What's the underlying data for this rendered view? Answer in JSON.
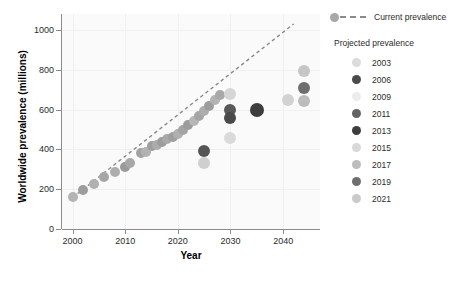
{
  "chart_data": {
    "type": "scatter",
    "title": "",
    "xlabel": "Year",
    "ylabel": "Worldwide prevalence (millions)",
    "xlim": [
      1998,
      2047
    ],
    "ylim": [
      0,
      1080
    ],
    "xticks": [
      2000,
      2010,
      2020,
      2030,
      2040
    ],
    "yticks": [
      0,
      200,
      400,
      600,
      800,
      1000
    ],
    "grid": true,
    "legend_position": "right",
    "trendline": {
      "label": "Current prevalence",
      "style": "dashed",
      "color": "#8a8a8a",
      "x_start": 2000,
      "y_start": 158,
      "x_end": 2042,
      "y_end": 1030
    },
    "series": [
      {
        "name": "Current prevalence",
        "marker": "circle",
        "points": [
          {
            "x": 2000,
            "y": 160,
            "color": "#b4b4b4",
            "size": 5
          },
          {
            "x": 2002,
            "y": 196,
            "color": "#9d9d9d",
            "size": 5
          },
          {
            "x": 2004,
            "y": 225,
            "color": "#b0b0b0",
            "size": 5
          },
          {
            "x": 2006,
            "y": 262,
            "color": "#a6a6a6",
            "size": 5
          },
          {
            "x": 2008,
            "y": 285,
            "color": "#aeaeae",
            "size": 5
          },
          {
            "x": 2010,
            "y": 311,
            "color": "#9a9a9a",
            "size": 5
          },
          {
            "x": 2011,
            "y": 330,
            "color": "#a8a8a8",
            "size": 5
          },
          {
            "x": 2013,
            "y": 382,
            "color": "#a2a2a2",
            "size": 5
          },
          {
            "x": 2014,
            "y": 387,
            "color": "#b2b2b2",
            "size": 5
          },
          {
            "x": 2015,
            "y": 415,
            "color": "#9e9e9e",
            "size": 5
          },
          {
            "x": 2016,
            "y": 422,
            "color": "#acacac",
            "size": 5
          },
          {
            "x": 2017,
            "y": 438,
            "color": "#9c9c9c",
            "size": 5
          },
          {
            "x": 2018,
            "y": 451,
            "color": "#a9a9a9",
            "size": 5
          },
          {
            "x": 2019,
            "y": 463,
            "color": "#9f9f9f",
            "size": 5
          },
          {
            "x": 2020,
            "y": 478,
            "color": "#b0b0b0",
            "size": 5
          },
          {
            "x": 2021,
            "y": 497,
            "color": "#a4a4a4",
            "size": 5
          },
          {
            "x": 2022,
            "y": 521,
            "color": "#9b9b9b",
            "size": 5
          },
          {
            "x": 2023,
            "y": 545,
            "color": "#b6b6b6",
            "size": 5
          },
          {
            "x": 2024,
            "y": 566,
            "color": "#a5a5a5",
            "size": 5
          },
          {
            "x": 2025,
            "y": 592,
            "color": "#adadad",
            "size": 5
          },
          {
            "x": 2026,
            "y": 618,
            "color": "#9d9d9d",
            "size": 5
          },
          {
            "x": 2027,
            "y": 648,
            "color": "#b3b3b3",
            "size": 5
          },
          {
            "x": 2028,
            "y": 672,
            "color": "#a8a8a8",
            "size": 5
          }
        ]
      },
      {
        "name": "Projected prevalence",
        "marker": "circle",
        "points": [
          {
            "x": 2025,
            "y": 392,
            "color": "#555555",
            "size": 6
          },
          {
            "x": 2025,
            "y": 334,
            "color": "#cfcfcf",
            "size": 6
          },
          {
            "x": 2030,
            "y": 676,
            "color": "#d6d6d6",
            "size": 6
          },
          {
            "x": 2030,
            "y": 596,
            "color": "#595959",
            "size": 6
          },
          {
            "x": 2030,
            "y": 556,
            "color": "#4a4a4a",
            "size": 6
          },
          {
            "x": 2030,
            "y": 455,
            "color": "#dadada",
            "size": 6
          },
          {
            "x": 2035,
            "y": 600,
            "color": "#3d3d3d",
            "size": 7
          },
          {
            "x": 2041,
            "y": 650,
            "color": "#d2d2d2",
            "size": 6
          },
          {
            "x": 2044,
            "y": 796,
            "color": "#c6c6c6",
            "size": 6
          },
          {
            "x": 2044,
            "y": 710,
            "color": "#6e6e6e",
            "size": 6
          },
          {
            "x": 2044,
            "y": 645,
            "color": "#bcbcbc",
            "size": 6
          }
        ]
      }
    ],
    "legend": {
      "current_label": "Current prevalence",
      "current_dot_color": "#a8a8a8",
      "projected_title": "Projected prevalence",
      "projected_entries": [
        {
          "label": "2003",
          "color": "#dcdcdc"
        },
        {
          "label": "2006",
          "color": "#4a4a4a"
        },
        {
          "label": "2009",
          "color": "#ececec"
        },
        {
          "label": "2011",
          "color": "#636363"
        },
        {
          "label": "2013",
          "color": "#3d3d3d"
        },
        {
          "label": "2015",
          "color": "#d8d8d8"
        },
        {
          "label": "2017",
          "color": "#bdbdbd"
        },
        {
          "label": "2019",
          "color": "#6e6e6e"
        },
        {
          "label": "2021",
          "color": "#cacaca"
        }
      ]
    }
  }
}
